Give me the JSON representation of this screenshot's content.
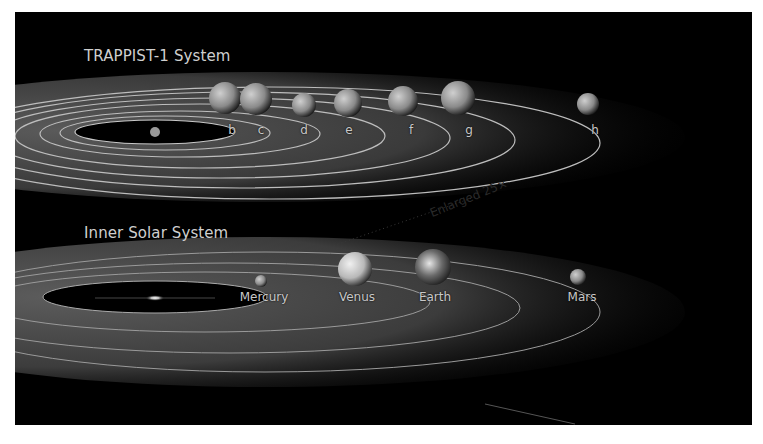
{
  "colors": {
    "background": "#ffffff",
    "panel": "#000000",
    "orbit": "#bdbdbd",
    "text": "#cfcfcf"
  },
  "trappist": {
    "title": "TRAPPIST-1 System",
    "star": "TRAPPIST-1",
    "planets": [
      {
        "label": "b"
      },
      {
        "label": "c"
      },
      {
        "label": "d"
      },
      {
        "label": "e"
      },
      {
        "label": "f"
      },
      {
        "label": "g"
      },
      {
        "label": "h"
      }
    ]
  },
  "solar": {
    "title": "Inner Solar System",
    "star": "Sun",
    "planets": [
      {
        "label": "Mercury"
      },
      {
        "label": "Venus"
      },
      {
        "label": "Earth"
      },
      {
        "label": "Mars"
      }
    ]
  },
  "annotation": {
    "enlarged": "Enlarged 25×"
  }
}
